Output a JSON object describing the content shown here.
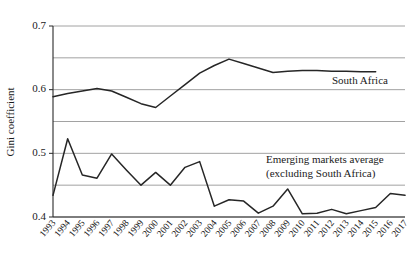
{
  "chart_data": {
    "type": "line",
    "title": "",
    "xlabel": "",
    "ylabel": "Gini coefficient",
    "ylim": [
      0.4,
      0.7
    ],
    "grid": true,
    "grid_values": [
      0.4,
      0.45,
      0.5,
      0.55,
      0.6,
      0.65,
      0.7
    ],
    "ytick_labels": [
      "0.7",
      "0.6",
      "0.5",
      "0.4"
    ],
    "ytick_values": [
      0.7,
      0.6,
      0.5,
      0.4
    ],
    "legend_position": "inline-annotation",
    "categories": [
      "1993",
      "1994",
      "1995",
      "1996",
      "1997",
      "1998",
      "1999",
      "2000",
      "2001",
      "2002",
      "2003",
      "2004",
      "2005",
      "2006",
      "2007",
      "2008",
      "2009",
      "2010",
      "2011",
      "2012",
      "2013",
      "2014",
      "2015",
      "2016",
      "2017"
    ],
    "x": [
      1993,
      1994,
      1995,
      1996,
      1997,
      1998,
      1999,
      2000,
      2001,
      2002,
      2003,
      2004,
      2005,
      2006,
      2007,
      2008,
      2009,
      2010,
      2011,
      2012,
      2013,
      2014,
      2015,
      2016,
      2017
    ],
    "series": [
      {
        "name": "South Africa",
        "color": "#262626",
        "values": [
          0.589,
          0.594,
          0.598,
          0.602,
          0.598,
          0.588,
          0.578,
          0.572,
          0.59,
          0.608,
          0.626,
          0.638,
          0.648,
          0.641,
          0.634,
          0.627,
          0.629,
          0.63,
          0.63,
          0.629,
          0.629,
          0.628,
          0.628,
          null,
          null
        ]
      },
      {
        "name": "Emerging markets average (excluding South Africa)",
        "color": "#262626",
        "values": [
          0.434,
          0.523,
          0.466,
          0.461,
          0.499,
          0.474,
          0.45,
          0.47,
          0.45,
          0.478,
          0.487,
          0.417,
          0.427,
          0.425,
          0.406,
          0.417,
          0.444,
          0.405,
          0.406,
          0.412,
          0.405,
          0.41,
          0.415,
          0.437,
          0.434
        ]
      }
    ],
    "annotations": [
      {
        "id": "south-africa-label",
        "text": "South Africa",
        "x_px": 332,
        "y_px": 84
      },
      {
        "id": "emerging-markets-label-line1",
        "text": "Emerging markets average",
        "x_px": 266,
        "y_px": 163
      },
      {
        "id": "emerging-markets-label-line2",
        "text": "(excluding South Africa)",
        "x_px": 266,
        "y_px": 177
      }
    ]
  }
}
